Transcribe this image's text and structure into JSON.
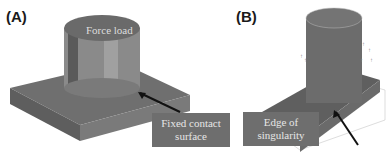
{
  "panels": [
    {
      "id": "A",
      "label": "(A)",
      "annotations": [
        {
          "text": "Force load",
          "kind": "on-surface"
        },
        {
          "text": "Fixed contact surface",
          "lines": [
            "Fixed contact",
            "surface"
          ],
          "kind": "callout"
        }
      ]
    },
    {
      "id": "B",
      "label": "(B)",
      "annotations": [
        {
          "text": "Edge of singularity",
          "lines": [
            "Edge of",
            "singularity"
          ],
          "kind": "callout"
        }
      ]
    }
  ],
  "colors": {
    "model_surface": "#6b6b6b",
    "callout_bg": "#6e6e6e",
    "callout_text": "#e6e6e6",
    "arrow": "#111111"
  }
}
